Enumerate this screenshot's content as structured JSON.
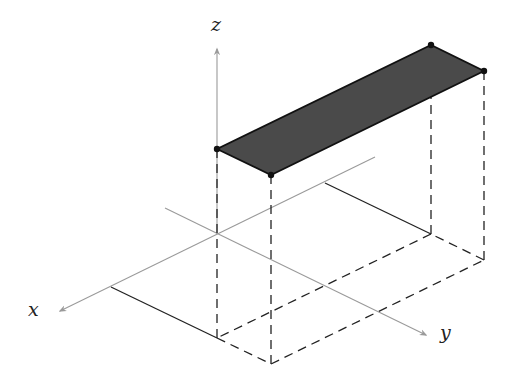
{
  "figure": {
    "type": "3d-coordinate-diagram",
    "axes": {
      "x": {
        "label": "x"
      },
      "y": {
        "label": "y"
      },
      "z": {
        "label": "z"
      }
    },
    "colors": {
      "axis": "#9a9a9a",
      "lines": "#222222",
      "plate_fill": "#4a4a4a",
      "plate_edge": "#111111",
      "background": "#ffffff"
    },
    "plate": {
      "corners": [
        "A",
        "B",
        "D",
        "C"
      ],
      "fill": "dark-gray"
    },
    "projection": {
      "style": "dashed",
      "vertical_edges": 4,
      "base_rectangle": "dashed with two solid edges along axes-parallel grid lines"
    }
  }
}
